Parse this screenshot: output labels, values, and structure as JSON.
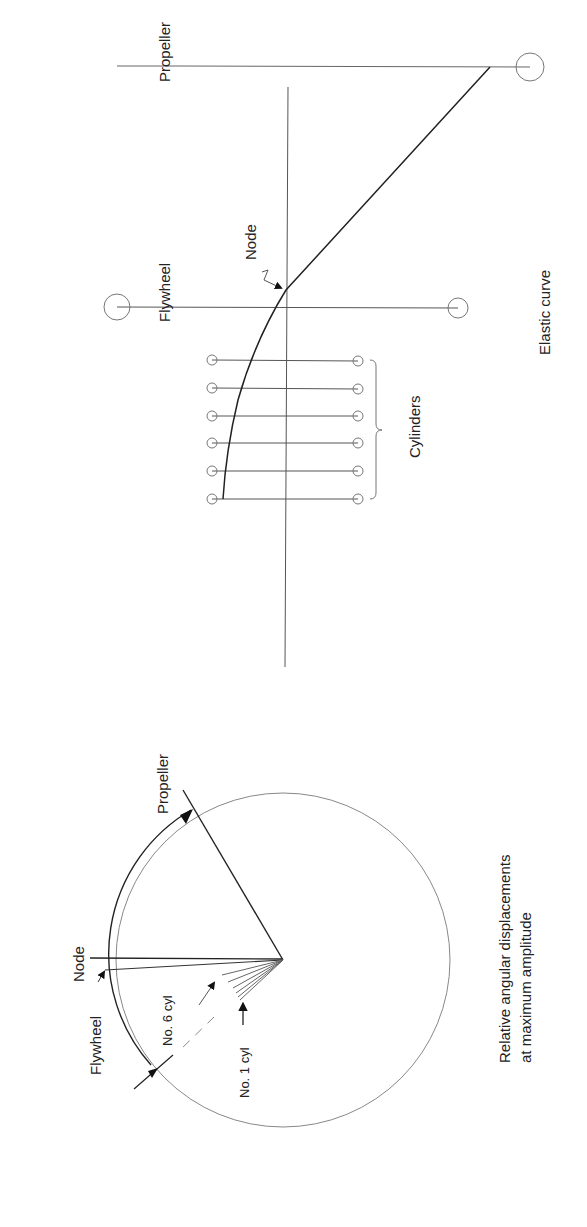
{
  "elastic_diagram": {
    "title": "Elastic curve",
    "labels": {
      "propeller": "Propeller",
      "flywheel": "Flywheel",
      "node": "Node",
      "cylinders": "Cylinders"
    },
    "cylinder_count": 6
  },
  "angular_diagram": {
    "caption_line1": "Relative angular displacements",
    "caption_line2": "at maximum amplitude",
    "labels": {
      "propeller": "Propeller",
      "node": "Node",
      "flywheel": "Flywheel",
      "no6": "No. 6 cyl",
      "no1": "No. 1 cyl"
    }
  },
  "colors": {
    "line": "#333333",
    "thin_line": "#777777",
    "text": "#222222"
  }
}
